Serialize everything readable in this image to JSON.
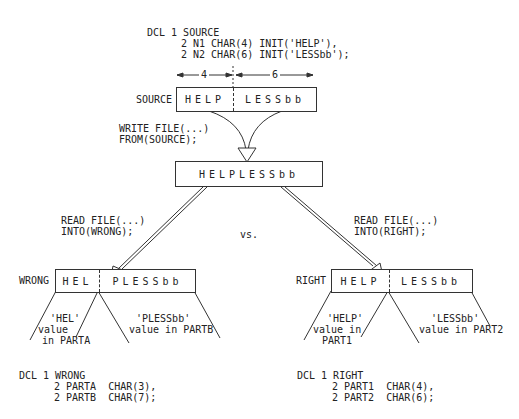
{
  "source_decl": {
    "line1": "DCL 1 SOURCE",
    "line2": "2 N1 CHAR(4) INIT('HELP'),",
    "line3": "2 N2 CHAR(6) INIT('LESSbb');"
  },
  "dimensions": {
    "left": "4",
    "right": "6"
  },
  "source_box": {
    "label": "SOURCE",
    "part1": "HELP",
    "part2": "LESSbb"
  },
  "write_stmt": {
    "line1": "WRITE FILE(...)",
    "line2": "FROM(SOURCE);"
  },
  "file_record": {
    "value": "HELPLESSbb"
  },
  "read_wrong": {
    "line1": "READ FILE(...)",
    "line2": "INTO(WRONG);"
  },
  "read_right": {
    "line1": "READ FILE(...)",
    "line2": "INTO(RIGHT);"
  },
  "vs_label": "vs.",
  "wrong_box": {
    "label": "WRONG",
    "part1": "HEL",
    "part2": "PLESSbb"
  },
  "right_box": {
    "label": "RIGHT",
    "part1": "HELP",
    "part2": "LESSbb"
  },
  "wrong_annotations": {
    "parta_l1": "'HEL'",
    "parta_l2": "value",
    "parta_l3": "in PARTA",
    "partb_l1": "'PLESSbb'",
    "partb_l2": "value in PARTB"
  },
  "right_annotations": {
    "part1_l1": "'HELP'",
    "part1_l2": "value in",
    "part1_l3": "PART1",
    "part2_l1": "'LESSbb'",
    "part2_l2": "value in PART2"
  },
  "wrong_decl": {
    "line1": "DCL 1 WRONG",
    "line2": "2 PARTA  CHAR(3),",
    "line3": "2 PARTB  CHAR(7);"
  },
  "right_decl": {
    "line1": "DCL 1 RIGHT",
    "line2": "2 PART1  CHAR(4),",
    "line3": "2 PART2  CHAR(6);"
  }
}
